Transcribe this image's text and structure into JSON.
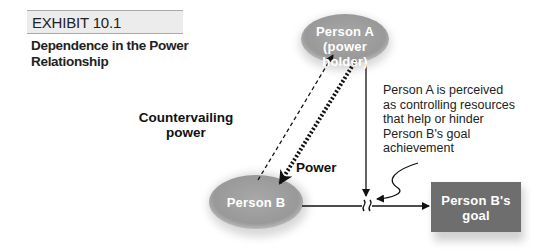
{
  "exhibit": {
    "label": "EXHIBIT 10.1",
    "title": "Dependence in the Power Relationship"
  },
  "nodes": {
    "person_a": {
      "line1": "Person A",
      "line2": "(power holder)"
    },
    "person_b": {
      "label": "Person B"
    },
    "goal": {
      "line1": "Person B's",
      "line2": "goal"
    }
  },
  "edges": {
    "countervailing": {
      "line1": "Countervailing",
      "line2": "power"
    },
    "power": {
      "label": "Power"
    }
  },
  "annotation": {
    "lines": [
      "Person A is perceived",
      "as controlling resources",
      "that help or hinder",
      "Person B's goal",
      "achievement"
    ]
  },
  "colors": {
    "ellipse": "#9a9a9a",
    "goal_box": "#6e6e6e",
    "exhibit_bar": "#ececec",
    "line": "#111111"
  }
}
